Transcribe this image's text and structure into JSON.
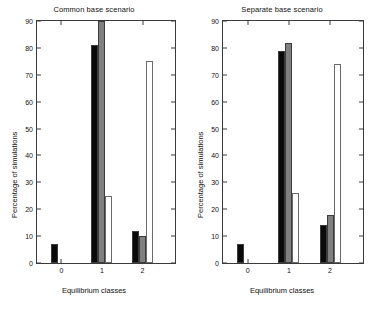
{
  "figure": {
    "background": "#ffffff",
    "axis_color": "#3a3a3a",
    "colors": {
      "black": "#0a0a0a",
      "gray": "#808080",
      "white": "#ffffff"
    }
  },
  "chart_data": [
    {
      "type": "bar",
      "title": "Common base scenario",
      "xlabel": "Equilibrium classes",
      "ylabel": "Percentage of simulations",
      "categories": [
        "0",
        "1",
        "2"
      ],
      "xlim": [
        -0.6,
        2.8
      ],
      "ylim": [
        0,
        90
      ],
      "yticks": [
        0,
        10,
        20,
        30,
        40,
        50,
        60,
        70,
        80,
        90
      ],
      "xticks": [
        0,
        1,
        2
      ],
      "grid": false,
      "legend": "none",
      "series": [
        {
          "name": "black",
          "color": "#0a0a0a",
          "values": [
            7,
            81,
            12
          ]
        },
        {
          "name": "gray",
          "color": "#808080",
          "values": [
            0,
            93,
            10
          ]
        },
        {
          "name": "white",
          "color": "#ffffff",
          "values": [
            0,
            25,
            75
          ]
        }
      ]
    },
    {
      "type": "bar",
      "title": "Separate base scenario",
      "xlabel": "Equilibrium classes",
      "ylabel": "Percentage of simulations",
      "categories": [
        "0",
        "1",
        "2"
      ],
      "xlim": [
        -0.6,
        2.8
      ],
      "ylim": [
        0,
        90
      ],
      "yticks": [
        0,
        10,
        20,
        30,
        40,
        50,
        60,
        70,
        80,
        90
      ],
      "xticks": [
        0,
        1,
        2
      ],
      "grid": false,
      "legend": "none",
      "series": [
        {
          "name": "black",
          "color": "#0a0a0a",
          "values": [
            7,
            79,
            14
          ]
        },
        {
          "name": "gray",
          "color": "#808080",
          "values": [
            0,
            82,
            18
          ]
        },
        {
          "name": "white",
          "color": "#ffffff",
          "values": [
            0,
            26,
            74
          ]
        }
      ]
    }
  ]
}
